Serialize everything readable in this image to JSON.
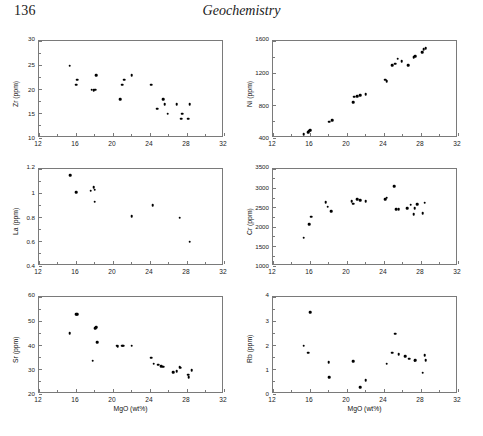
{
  "header": {
    "folio": "136",
    "running_title": "Geochemistry"
  },
  "figure": {
    "x_axis_label": "MgO (wt%)",
    "x_ticks": [
      "12",
      "16",
      "20",
      "24",
      "28",
      "32"
    ],
    "caption": ""
  },
  "chart_data": [
    {
      "type": "scatter",
      "title": "",
      "xlabel": "MgO (wt%)",
      "ylabel": "Zr (ppm)",
      "xlim": [
        12,
        32
      ],
      "ylim": [
        10,
        30
      ],
      "xticks": [
        12,
        16,
        20,
        24,
        28,
        32
      ],
      "yticks": [
        10,
        15,
        20,
        25,
        30
      ],
      "grid": false,
      "legend": "none",
      "x": [
        15.3,
        16.1,
        16.0,
        17.7,
        17.9,
        18.1,
        18.2,
        20.8,
        21.0,
        21.2,
        22.0,
        24.1,
        24.8,
        25.4,
        25.6,
        25.9,
        26.9,
        27.4,
        27.5,
        28.1,
        28.3
      ],
      "y": [
        24.9,
        22.0,
        21.0,
        20.0,
        19.9,
        20.0,
        23.0,
        18.0,
        21.0,
        22.0,
        23.0,
        21.0,
        16.0,
        18.0,
        17.0,
        15.0,
        17.0,
        14.0,
        15.0,
        14.0,
        17.0
      ]
    },
    {
      "type": "scatter",
      "title": "",
      "xlabel": "MgO (wt%)",
      "ylabel": "Ni (ppm)",
      "xlim": [
        12,
        32
      ],
      "ylim": [
        400,
        1600
      ],
      "xticks": [
        12,
        16,
        20,
        24,
        28,
        32
      ],
      "yticks": [
        400,
        800,
        1200,
        1600
      ],
      "grid": false,
      "legend": "none",
      "x": [
        15.3,
        15.8,
        15.9,
        16.0,
        18.1,
        18.4,
        20.7,
        20.8,
        21.1,
        21.4,
        22.0,
        24.1,
        24.3,
        24.9,
        25.2,
        25.5,
        25.9,
        26.6,
        27.2,
        27.4,
        28.1,
        28.3,
        28.5
      ],
      "y": [
        450,
        470,
        490,
        500,
        600,
        620,
        840,
        910,
        920,
        930,
        940,
        1120,
        1100,
        1300,
        1320,
        1380,
        1350,
        1300,
        1400,
        1410,
        1460,
        1500,
        1510
      ]
    },
    {
      "type": "scatter",
      "title": "",
      "xlabel": "MgO (wt%)",
      "ylabel": "La (ppm)",
      "xlim": [
        12,
        32
      ],
      "ylim": [
        0.4,
        1.2
      ],
      "xticks": [
        12,
        16,
        20,
        24,
        28,
        32
      ],
      "yticks": [
        0.4,
        0.6,
        0.8,
        1.0,
        1.2
      ],
      "grid": false,
      "legend": "none",
      "x": [
        15.4,
        16.0,
        17.6,
        17.9,
        18.0,
        18.0,
        22.0,
        24.3,
        27.2,
        28.3
      ],
      "y": [
        1.15,
        1.01,
        1.02,
        1.05,
        1.03,
        0.93,
        0.81,
        0.9,
        0.8,
        0.6
      ]
    },
    {
      "type": "scatter",
      "title": "",
      "xlabel": "MgO (wt%)",
      "ylabel": "Cr (ppm)",
      "xlim": [
        12,
        32
      ],
      "ylim": [
        1000,
        3500
      ],
      "xticks": [
        12,
        16,
        20,
        24,
        28,
        32
      ],
      "yticks": [
        1000,
        1500,
        2000,
        2500,
        3000,
        3500
      ],
      "grid": false,
      "legend": "none",
      "x": [
        15.3,
        15.9,
        16.1,
        17.7,
        17.9,
        18.3,
        20.5,
        20.7,
        21.1,
        21.4,
        22.0,
        24.1,
        24.3,
        25.1,
        25.3,
        25.6,
        26.5,
        26.9,
        27.2,
        27.3,
        27.6,
        28.2,
        28.4
      ],
      "y": [
        1730,
        2070,
        2270,
        2650,
        2530,
        2410,
        2670,
        2610,
        2720,
        2700,
        2670,
        2720,
        2760,
        3060,
        2460,
        2470,
        2490,
        2580,
        2330,
        2490,
        2600,
        2360,
        2630
      ]
    },
    {
      "type": "scatter",
      "title": "",
      "xlabel": "MgO (wt%)",
      "ylabel": "Sr (ppm)",
      "xlim": [
        12,
        32
      ],
      "ylim": [
        20,
        60
      ],
      "xticks": [
        12,
        16,
        20,
        24,
        28,
        32
      ],
      "yticks": [
        20,
        30,
        40,
        50,
        60
      ],
      "grid": false,
      "legend": "none",
      "x": [
        15.3,
        16.0,
        16.1,
        17.8,
        18.1,
        18.2,
        18.3,
        20.4,
        20.5,
        21.0,
        21.1,
        22.0,
        24.1,
        24.4,
        24.9,
        25.2,
        25.4,
        26.5,
        26.9,
        27.2,
        27.3,
        28.1,
        28.2,
        28.5
      ],
      "y": [
        45.0,
        53.0,
        53.0,
        33.8,
        47.2,
        47.5,
        41.3,
        40.0,
        39.6,
        39.9,
        40.0,
        39.9,
        35.0,
        32.5,
        32.0,
        31.5,
        31.2,
        29.0,
        29.3,
        31.0,
        30.8,
        28.0,
        27.0,
        29.7
      ]
    },
    {
      "type": "scatter",
      "title": "",
      "xlabel": "MgO (wt%)",
      "ylabel": "Rb (ppm)",
      "xlim": [
        12,
        32
      ],
      "ylim": [
        0,
        4
      ],
      "xticks": [
        12,
        16,
        20,
        24,
        28,
        32
      ],
      "yticks": [
        0,
        1,
        2,
        3,
        4
      ],
      "grid": false,
      "legend": "none",
      "x": [
        15.3,
        15.8,
        16.0,
        18.0,
        18.1,
        20.7,
        21.4,
        22.0,
        24.3,
        24.9,
        25.2,
        25.6,
        26.3,
        26.7,
        27.3,
        27.4,
        28.2,
        28.4,
        28.5
      ],
      "y": [
        2.0,
        1.7,
        3.38,
        1.3,
        0.7,
        1.35,
        0.28,
        0.58,
        1.25,
        1.7,
        2.48,
        1.65,
        1.55,
        1.45,
        1.38,
        1.4,
        0.88,
        1.6,
        1.4
      ]
    }
  ]
}
